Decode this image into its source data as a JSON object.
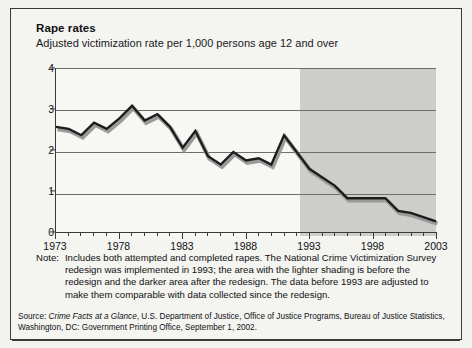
{
  "figure": {
    "title": "Rape rates",
    "subtitle": "Adjusted victimization rate per 1,000 persons age 12 and over",
    "note_label": "Note:",
    "note_text": "Includes both attempted and completed rapes. The National Crime Victimization Survey redesign was implemented in 1993; the area with the lighter shading is before the redesign and the darker area after the redesign. The data before 1993 are adjusted to make them comparable with data collected since the redesign.",
    "source_prefix": "Source: ",
    "source_italic": "Crime Facts at a Glance",
    "source_rest": ", U.S. Department of Justice, Office of Justice Programs, Bureau of Justice Statistics, Washington, DC: Government Printing Office, September 1, 2002."
  },
  "colors": {
    "line": "#1c1c1c",
    "line_shadow": "#9a9a9a",
    "band_light": "#f7f7f4",
    "band_dark": "#cdcdc9",
    "grid": "#6d6d6d",
    "axis": "#3a3a3a",
    "page_background": "#f4f4f1",
    "frame": "#3a3a3a"
  },
  "chart_data": {
    "type": "line",
    "title": "Rape rates",
    "subtitle": "Adjusted victimization rate per 1,000 persons age 12 and over",
    "xlabel": "",
    "ylabel": "Adjusted victimization rate per 1,000 persons age 12 and over",
    "xlim": [
      1973,
      2003
    ],
    "ylim": [
      0,
      4
    ],
    "yticks": [
      0,
      1,
      2,
      3,
      4
    ],
    "ytick_labels": [
      "0",
      "1",
      "2",
      "3",
      "4"
    ],
    "xticks": [
      1973,
      1978,
      1983,
      1988,
      1993,
      1998,
      2003
    ],
    "xtick_labels": [
      "1973",
      "1978",
      "1983",
      "1988",
      "1993",
      "1998",
      "2003"
    ],
    "minor_xticks_every": 1,
    "grid": "horizontal",
    "legend": "none",
    "shaded_regions": [
      {
        "name": "before-redesign",
        "from": 1973,
        "to": 1992.3,
        "color": "#f7f7f4",
        "label": "lighter shading, before the redesign"
      },
      {
        "name": "after-redesign",
        "from": 1992.3,
        "to": 2003,
        "color": "#cdcdc9",
        "label": "darker area, after the redesign"
      }
    ],
    "x": [
      1973,
      1974,
      1975,
      1976,
      1977,
      1978,
      1979,
      1980,
      1981,
      1982,
      1983,
      1984,
      1985,
      1986,
      1987,
      1988,
      1989,
      1990,
      1991,
      1992,
      1993,
      1994,
      1995,
      1996,
      1997,
      1998,
      1999,
      2000,
      2001,
      2002,
      2003
    ],
    "values": [
      2.6,
      2.55,
      2.4,
      2.7,
      2.55,
      2.8,
      3.1,
      2.75,
      2.9,
      2.6,
      2.1,
      2.5,
      1.9,
      1.7,
      2.0,
      1.8,
      1.85,
      1.7,
      2.4,
      2.0,
      1.6,
      1.4,
      1.2,
      0.9,
      0.9,
      0.9,
      0.9,
      0.6,
      0.55,
      0.45,
      0.35
    ],
    "series": [
      {
        "name": "Adjusted victimization rate per 1,000 persons age 12 and over",
        "values": [
          2.6,
          2.55,
          2.4,
          2.7,
          2.55,
          2.8,
          3.1,
          2.75,
          2.9,
          2.6,
          2.1,
          2.5,
          1.9,
          1.7,
          2.0,
          1.8,
          1.85,
          1.7,
          2.4,
          2.0,
          1.6,
          1.4,
          1.2,
          0.9,
          0.9,
          0.9,
          0.9,
          0.6,
          0.55,
          0.45,
          0.35
        ]
      }
    ]
  }
}
